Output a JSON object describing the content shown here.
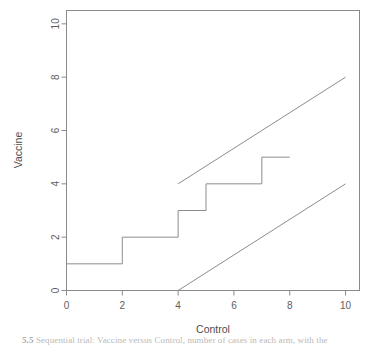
{
  "figure": {
    "background": "#ffffff",
    "line_color": "#8c8c8c",
    "axis_color": "#8a8a8a",
    "text_color": "#5e5e5e"
  },
  "caption": {
    "clipped": true,
    "number": "5.5",
    "text": "Sequential trial: Vaccine versus Control, number of cases in each arm, with the"
  },
  "chart_data": {
    "type": "line",
    "title": "",
    "subtitle": "",
    "xlabel": "Control",
    "ylabel": "Vaccine",
    "xlim": [
      0,
      10.5
    ],
    "ylim": [
      0,
      10.5
    ],
    "xticks": [
      0,
      2,
      4,
      6,
      8,
      10
    ],
    "yticks": [
      0,
      2,
      4,
      6,
      8,
      10
    ],
    "xticklabels": [
      "0",
      "2",
      "4",
      "6",
      "8",
      "10"
    ],
    "yticklabels": [
      "0",
      "2",
      "4",
      "6",
      "8",
      "10"
    ],
    "grid": false,
    "legend": null,
    "box": true,
    "series": [
      {
        "name": "step-path",
        "style": "step",
        "draw": "steps-post",
        "points": [
          [
            0,
            0
          ],
          [
            0,
            1
          ],
          [
            2,
            1
          ],
          [
            2,
            2
          ],
          [
            4,
            2
          ],
          [
            4,
            3
          ],
          [
            5,
            3
          ],
          [
            5,
            4
          ],
          [
            7,
            4
          ],
          [
            7,
            5
          ],
          [
            8,
            5
          ]
        ]
      },
      {
        "name": "upper-boundary-line",
        "style": "straight",
        "points": [
          [
            4,
            4
          ],
          [
            10,
            8
          ]
        ]
      },
      {
        "name": "lower-boundary-line",
        "style": "straight",
        "points": [
          [
            4,
            0
          ],
          [
            10,
            4
          ]
        ]
      }
    ],
    "annotations": []
  }
}
